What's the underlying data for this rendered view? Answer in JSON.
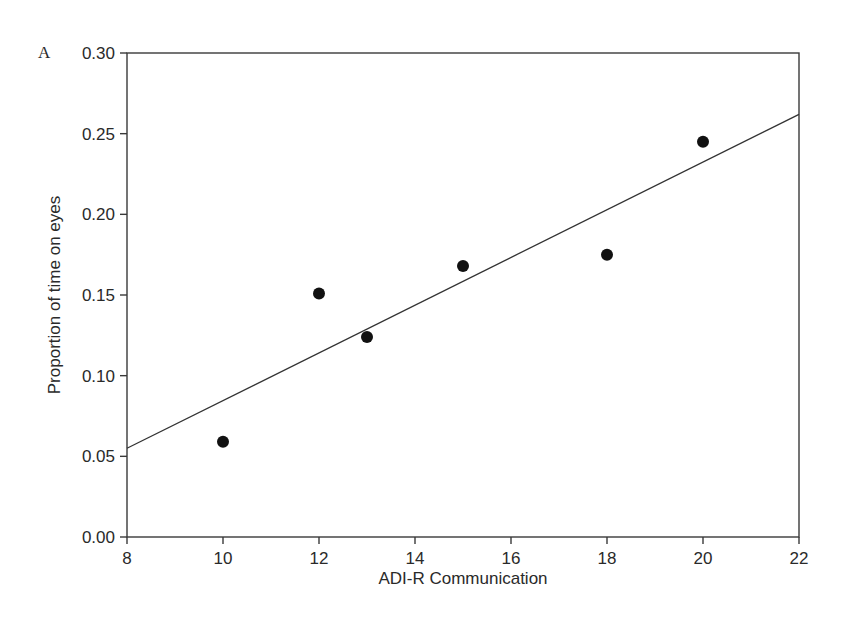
{
  "chart_data": {
    "type": "scatter",
    "panel_label": "A",
    "title": "",
    "xlabel": "ADI-R Communication",
    "ylabel": "Proportion of time on eyes",
    "xlim": [
      8,
      22
    ],
    "ylim": [
      0.0,
      0.3
    ],
    "xticks": [
      8,
      10,
      12,
      14,
      16,
      18,
      20,
      22
    ],
    "xtick_labels": [
      "8",
      "10",
      "12",
      "14",
      "16",
      "18",
      "20",
      "22"
    ],
    "yticks": [
      0.0,
      0.05,
      0.1,
      0.15,
      0.2,
      0.25,
      0.3
    ],
    "ytick_labels": [
      "0.00",
      "0.05",
      "0.10",
      "0.15",
      "0.20",
      "0.25",
      "0.30"
    ],
    "grid": false,
    "legend": null,
    "series": [
      {
        "name": "participants",
        "marker": "filled-circle",
        "color": "#111111",
        "x": [
          10,
          12,
          13,
          15,
          18,
          20
        ],
        "y": [
          0.059,
          0.151,
          0.124,
          0.168,
          0.175,
          0.245
        ]
      }
    ],
    "fit_line": {
      "type": "linear-regression",
      "color": "#333333",
      "x": [
        8,
        22
      ],
      "y": [
        0.055,
        0.262
      ]
    }
  }
}
